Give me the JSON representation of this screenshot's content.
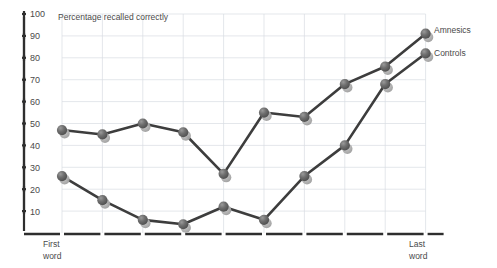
{
  "chart_data": {
    "type": "line",
    "title": "Percentage recalled correctly",
    "xlabel": "",
    "ylabel": "",
    "ylim": [
      0,
      100
    ],
    "yticks": [
      10,
      20,
      30,
      40,
      50,
      60,
      70,
      80,
      90,
      100
    ],
    "grid": true,
    "legend_position": "right",
    "x_tick_labels": {
      "first": "First\nword",
      "first_line1": "First",
      "first_line2": "word",
      "last_line1": "Last",
      "last_line2": "word"
    },
    "x": [
      1,
      2,
      3,
      4,
      5,
      6,
      7,
      8,
      9,
      10
    ],
    "series": [
      {
        "name": "Amnesics",
        "color": "#6e6e6e",
        "values": [
          47,
          45,
          50,
          46,
          27,
          55,
          53,
          68,
          76,
          91
        ]
      },
      {
        "name": "Controls",
        "color": "#8a8a8a",
        "values": [
          26,
          15,
          6,
          4,
          12,
          6,
          26,
          40,
          68,
          82
        ]
      }
    ]
  },
  "axis": {
    "y_labels": [
      "100",
      "90",
      "80",
      "70",
      "60",
      "50",
      "40",
      "30",
      "20",
      "10"
    ]
  },
  "annotations": {
    "first_word_line1": "First",
    "first_word_line2": "word",
    "last_word_line1": "Last",
    "last_word_line2": "word"
  },
  "legend": {
    "amnesics": "Amnesics",
    "controls": "Controls"
  },
  "colors": {
    "marker_dark": "#6b6b6b",
    "marker_light": "#b4b4b4",
    "line": "#3d3d3d",
    "grid": "#d9dde2",
    "axis": "#2e2e2e",
    "text": "#4a4a4a",
    "background": "#ffffff"
  }
}
